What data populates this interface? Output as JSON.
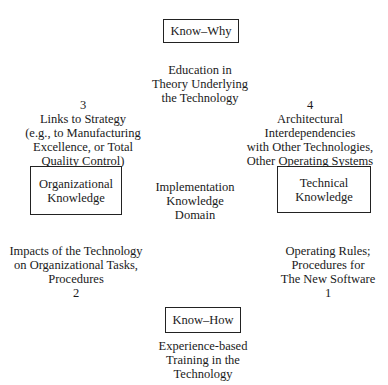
{
  "boxes": {
    "know_why": "Know–Why",
    "know_how": "Know–How",
    "organizational": [
      "Organizational",
      "Knowledge"
    ],
    "technical": [
      "Technical",
      "Knowledge"
    ]
  },
  "center": [
    "Implementation",
    "Knowledge",
    "Domain"
  ],
  "top_text": [
    "Education in",
    "Theory Underlying",
    "the Technology"
  ],
  "bottom_text": [
    "Experience-based",
    "Training in the",
    "Technology"
  ],
  "quadrants": {
    "q3": {
      "number": "3",
      "lines": [
        "Links to Strategy",
        "(e.g., to Manufacturing",
        "Excellence, or Total",
        "Quality Control)"
      ]
    },
    "q4": {
      "number": "4",
      "lines": [
        "Architectural",
        "Interdependencies",
        "with Other Technologies,",
        "Other Operating Systems"
      ]
    },
    "q2": {
      "number": "2",
      "lines": [
        "Impacts of the Technology",
        "on Organizational Tasks,",
        "Procedures"
      ]
    },
    "q1": {
      "number": "1",
      "lines": [
        "Operating Rules;",
        "Procedures for",
        "The New Software"
      ]
    }
  }
}
